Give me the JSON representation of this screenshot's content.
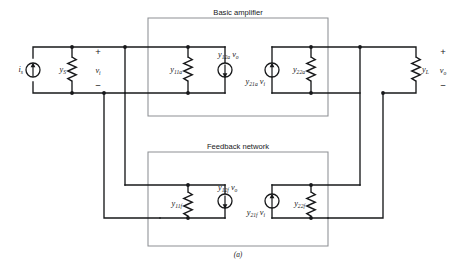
{
  "figure": {
    "caption": "(a)"
  },
  "blocks": {
    "amplifier": {
      "title": "Basic amplifier",
      "input_conductance": "y",
      "input_conductance_sub": "11a",
      "reverse_source": "y",
      "reverse_source_sub": "12a",
      "reverse_source_var": "v",
      "reverse_source_var_sub": "o",
      "forward_source": "y",
      "forward_source_sub": "21a",
      "forward_source_var": "v",
      "forward_source_var_sub": "i",
      "output_conductance": "y",
      "output_conductance_sub": "22a"
    },
    "feedback": {
      "title": "Feedback network",
      "input_conductance": "y",
      "input_conductance_sub": "11f",
      "reverse_source": "y",
      "reverse_source_sub": "12f",
      "reverse_source_var": "v",
      "reverse_source_var_sub": "o",
      "forward_source": "y",
      "forward_source_sub": "21f",
      "forward_source_var": "v",
      "forward_source_var_sub": "i",
      "output_conductance": "y",
      "output_conductance_sub": "22f"
    }
  },
  "source": {
    "current_symbol": "i",
    "current_sub": "s",
    "conductance_symbol": "y",
    "conductance_sub": "S"
  },
  "load": {
    "conductance_symbol": "y",
    "conductance_sub": "L"
  },
  "ports": {
    "input_voltage": "v",
    "input_voltage_sub": "i",
    "output_voltage": "v",
    "output_voltage_sub": "o",
    "plus": "+",
    "minus": "−"
  },
  "colors": {
    "wire": "#17181a",
    "box_outline": "#8d9094",
    "background": "#ffffff"
  }
}
